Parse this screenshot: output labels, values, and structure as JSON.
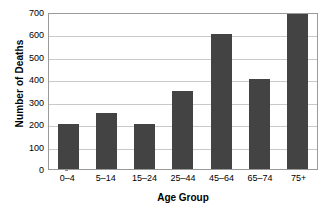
{
  "chart_data": {
    "type": "bar",
    "title": "",
    "xlabel": "Age Group",
    "ylabel": "Number of Deaths",
    "categories": [
      "0–4",
      "5–14",
      "15–24",
      "25–44",
      "45–64",
      "65–74",
      "75+"
    ],
    "values": [
      200,
      250,
      200,
      350,
      600,
      400,
      700
    ],
    "ylim": [
      0,
      700
    ],
    "yticks": [
      0,
      100,
      200,
      300,
      400,
      500,
      600,
      700
    ],
    "ytick_labels": [
      "0",
      "100",
      "200",
      "300",
      "400",
      "500",
      "600",
      "700"
    ],
    "grid": true,
    "grid_axis": "y",
    "legend": false,
    "legend_position": "none",
    "series": [
      {
        "name": "Number of Deaths",
        "values": [
          200,
          250,
          200,
          350,
          600,
          400,
          700
        ],
        "color": "#434343"
      }
    ],
    "colors": {
      "bar": "#434343",
      "gridline": "#c9c9c9",
      "axis_border": "#9a9a9a",
      "background": "#ffffff",
      "text": "#000000"
    }
  }
}
